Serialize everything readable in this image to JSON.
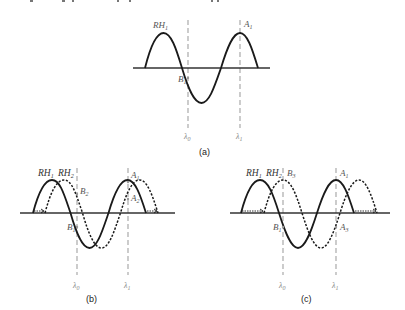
{
  "figure": {
    "top_text_fragment": "...p ... ty p ... p ... p ... g y ...",
    "panels": [
      {
        "id": "a",
        "caption": "(a)",
        "curves": [
          {
            "label": "RH",
            "sub": "1",
            "style": "solid"
          }
        ],
        "markers": [
          {
            "label": "B",
            "sub": "1"
          },
          {
            "label": "A",
            "sub": "1"
          }
        ],
        "lambdas": [
          {
            "label": "λ",
            "sub": "0"
          },
          {
            "label": "λ",
            "sub": "1"
          }
        ]
      },
      {
        "id": "b",
        "caption": "(b)",
        "curves": [
          {
            "label": "RH",
            "sub": "1",
            "style": "solid"
          },
          {
            "label": "RH",
            "sub": "2",
            "style": "dotted"
          }
        ],
        "markers": [
          {
            "label": "B",
            "sub": "2"
          },
          {
            "label": "B",
            "sub": "1"
          },
          {
            "label": "A",
            "sub": "1"
          },
          {
            "label": "A",
            "sub": "2"
          }
        ],
        "lambdas": [
          {
            "label": "λ",
            "sub": "0"
          },
          {
            "label": "λ",
            "sub": "1"
          }
        ]
      },
      {
        "id": "c",
        "caption": "(c)",
        "curves": [
          {
            "label": "RH",
            "sub": "1",
            "style": "solid"
          },
          {
            "label": "RH",
            "sub": "2",
            "style": "dotted"
          }
        ],
        "markers": [
          {
            "label": "B",
            "sub": "3"
          },
          {
            "label": "B",
            "sub": "1"
          },
          {
            "label": "A",
            "sub": "1"
          },
          {
            "label": "A",
            "sub": "3"
          }
        ],
        "lambdas": [
          {
            "label": "λ",
            "sub": "0"
          },
          {
            "label": "λ",
            "sub": "1"
          }
        ]
      }
    ],
    "colors": {
      "curve": "#1a1a1a",
      "axis": "#333333",
      "guide": "#aaaaaa",
      "label": "#555555"
    }
  }
}
